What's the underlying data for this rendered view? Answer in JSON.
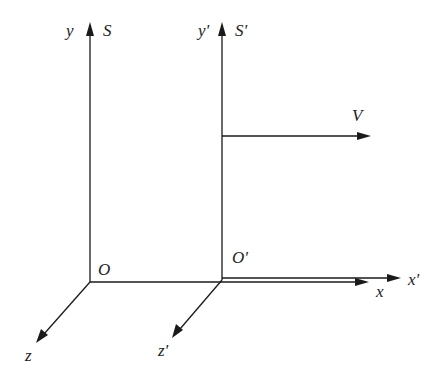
{
  "diagram": {
    "frames": [
      {
        "name": "S",
        "origin_label": "O",
        "axes": {
          "x": "x",
          "y": "y",
          "z": "z"
        }
      },
      {
        "name": "S'",
        "origin_label": "O'",
        "axes": {
          "x": "x'",
          "y": "y'",
          "z": "z'"
        }
      }
    ],
    "velocity_label": "V",
    "colors": {
      "line": "#1a1a1a",
      "text": "#222222",
      "background": "#ffffff"
    }
  }
}
